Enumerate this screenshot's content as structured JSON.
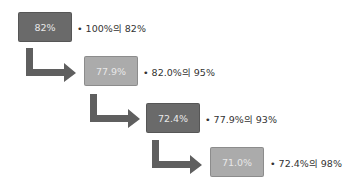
{
  "diagram": {
    "colors": {
      "dark_box": "#6a6a6a",
      "light_box": "#ababab",
      "arrow": "#5f5f5f",
      "text": "#333333"
    },
    "steps": [
      {
        "value": "82%",
        "note": "100%의 82%",
        "style": "dark"
      },
      {
        "value": "77.9%",
        "note": "82.0%의 95%",
        "style": "light"
      },
      {
        "value": "72.4%",
        "note": "77.9%의 93%",
        "style": "dark"
      },
      {
        "value": "71.0%",
        "note": "72.4%의 98%",
        "style": "light"
      }
    ],
    "bullet": "•"
  }
}
